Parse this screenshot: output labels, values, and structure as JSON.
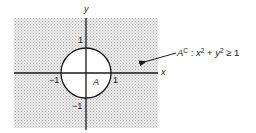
{
  "diagram": {
    "type": "set-complement-unit-disk",
    "axes": {
      "x_label": "x",
      "y_label": "y",
      "x_ticks": [
        {
          "value": -1,
          "label": "−1"
        },
        {
          "value": 1,
          "label": "1"
        }
      ],
      "y_ticks": [
        {
          "value": 1,
          "label": "1"
        },
        {
          "value": -1,
          "label": "−1"
        }
      ]
    },
    "circle": {
      "center": [
        0,
        0
      ],
      "radius": 1,
      "region_label": "A"
    },
    "shaded_region": {
      "label": "Aᶜ",
      "description": "outside the unit circle, shaded with dot pattern",
      "fill_color": "#c8c8c8"
    },
    "annotation": {
      "set_name": "A",
      "superscript": "C",
      "separator": " : ",
      "expr_x": "x",
      "expr_x_exp": "2",
      "expr_plus": " + ",
      "expr_y": "y",
      "expr_y_exp": "2",
      "expr_relation": " ≥ 1",
      "full_text": "A^C : x^2 + y^2 ≥ 1"
    },
    "colors": {
      "line": "#1a1a1a",
      "shade_dots": "#9a9a9a",
      "background": "#ffffff"
    }
  }
}
